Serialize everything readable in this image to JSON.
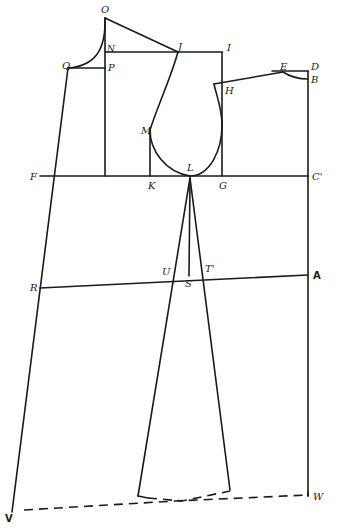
{
  "figure": {
    "type": "pattern drafting diagram",
    "line_color": "#1a1a1a",
    "background": "#ffffff"
  },
  "labels": {
    "O": "O",
    "N": "N",
    "J": "J",
    "I": "I",
    "Q": "Q",
    "P": "P",
    "E": "E",
    "D": "D",
    "B": "B",
    "H": "H",
    "M": "M",
    "L": "L",
    "F": "F",
    "K": "K",
    "G": "G",
    "C": "C'",
    "R": "R",
    "U": "U",
    "T": "T'",
    "S": "S",
    "A": "A",
    "V": "V",
    "W": "W"
  }
}
